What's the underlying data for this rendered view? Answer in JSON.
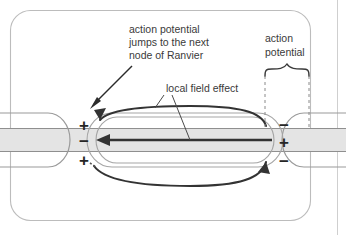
{
  "figure": {
    "title_absent": true,
    "background_color": "#ffffff",
    "border_color": "#b9b9b9",
    "ink_color": "#3a3a3a",
    "axon_band_color": "#e2e2e2",
    "membrane_line_color": "#8c8c8c"
  },
  "annotations": {
    "jump_label": {
      "line1": "action potential",
      "line2": "jumps to the next",
      "line3": "node of Ranvier"
    },
    "action_potential_label": {
      "line1": "action",
      "line2": "potential"
    },
    "local_field_label": {
      "line1": "local field effect"
    }
  },
  "charges": {
    "left_node": [
      "+",
      "−",
      "+"
    ],
    "right_node": [
      "−",
      "+",
      "−"
    ]
  },
  "icons": {
    "jump_arrow": "arrow-down-left-icon",
    "axial_current_arrow": "arrow-left-icon",
    "outer_loop_top_arrow": "arrow-loop-top-icon",
    "outer_loop_bottom_arrow": "arrow-loop-bottom-icon",
    "brace": "curly-brace-icon",
    "leader_line_a": "leader-line-icon",
    "leader_line_b": "leader-line-icon",
    "dashed_marker_left": "dashed-vertical-line-icon",
    "dashed_marker_right": "dashed-vertical-line-icon"
  }
}
